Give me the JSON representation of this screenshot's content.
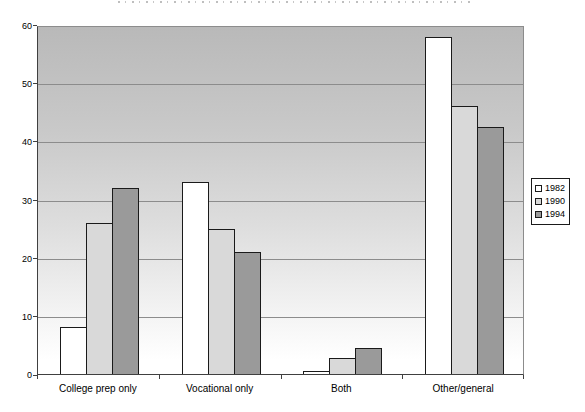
{
  "chart_data": {
    "type": "bar",
    "title": "",
    "title_note_visible_pixels": "title is cropped at top edge; only letter fragments visible",
    "categories": [
      "College prep only",
      "Vocational only",
      "Both",
      "Other/general"
    ],
    "series": [
      {
        "name": "1982",
        "color": "#ffffff",
        "values": [
          8,
          33,
          0.6,
          58
        ]
      },
      {
        "name": "1990",
        "color": "#d9d9d9",
        "values": [
          26,
          25,
          2.7,
          46
        ]
      },
      {
        "name": "1994",
        "color": "#9a9a9a",
        "values": [
          32,
          21,
          4.4,
          42.4
        ]
      }
    ],
    "xlabel": "",
    "ylabel": "",
    "ylim": [
      0,
      60
    ],
    "yticks": [
      0,
      10,
      20,
      30,
      40,
      50,
      60
    ],
    "grid": true,
    "legend_position": "right",
    "plot_background": {
      "top": "#b9b9b9",
      "bottom": "#ffffff"
    },
    "gridline_color": "#8c8c8c",
    "bar_border_color": "#1a1a1a"
  }
}
